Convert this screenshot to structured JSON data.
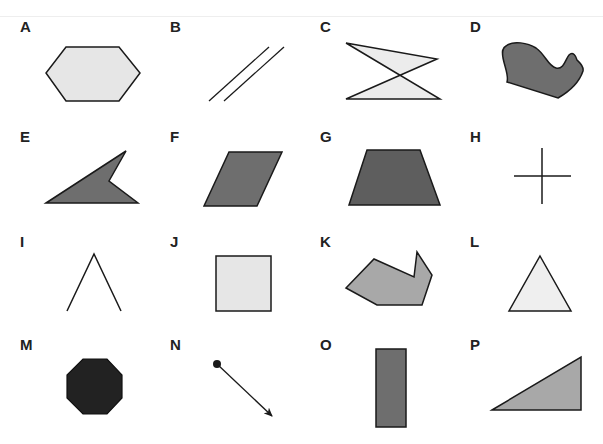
{
  "figure": {
    "colors": {
      "stroke": "#1a1a1a",
      "light_fill": "#e6e6e6",
      "mid_fill": "#a8a8a8",
      "dark_fill": "#6e6e6e",
      "black_fill": "#222222"
    },
    "shapes": [
      {
        "label": "A",
        "kind": "hexagon",
        "fill": "light"
      },
      {
        "label": "B",
        "kind": "parallel lines",
        "fill": "none"
      },
      {
        "label": "C",
        "kind": "self-intersecting quadrilateral (bow-tie)",
        "fill": "light"
      },
      {
        "label": "D",
        "kind": "irregular curved shape",
        "fill": "dark"
      },
      {
        "label": "E",
        "kind": "concave quadrilateral (arrowhead)",
        "fill": "dark"
      },
      {
        "label": "F",
        "kind": "parallelogram",
        "fill": "dark"
      },
      {
        "label": "G",
        "kind": "trapezoid",
        "fill": "dark"
      },
      {
        "label": "H",
        "kind": "intersecting lines (cross)",
        "fill": "none"
      },
      {
        "label": "I",
        "kind": "angle (two segments)",
        "fill": "none"
      },
      {
        "label": "J",
        "kind": "square",
        "fill": "light"
      },
      {
        "label": "K",
        "kind": "concave heptagon",
        "fill": "mid"
      },
      {
        "label": "L",
        "kind": "equilateral triangle",
        "fill": "light"
      },
      {
        "label": "M",
        "kind": "octagon",
        "fill": "black"
      },
      {
        "label": "N",
        "kind": "ray",
        "fill": "none"
      },
      {
        "label": "O",
        "kind": "rectangle",
        "fill": "dark"
      },
      {
        "label": "P",
        "kind": "right triangle",
        "fill": "mid"
      }
    ]
  }
}
